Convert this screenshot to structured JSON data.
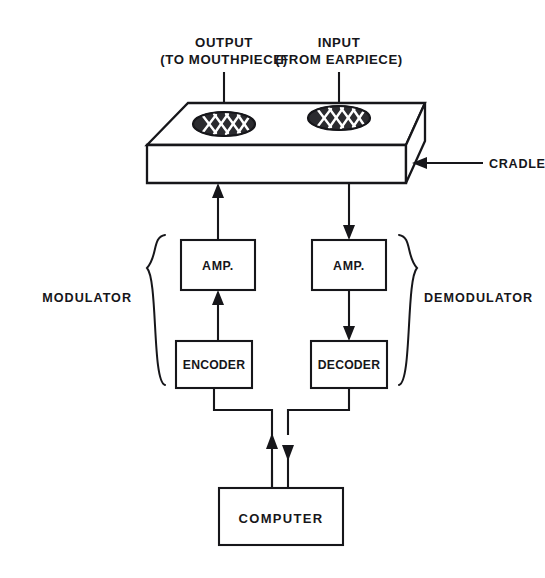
{
  "diagram": {
    "background_color": "#ffffff",
    "ink_color": "#16161a",
    "grille_fill_color": "#2b2b2f"
  },
  "captions": {
    "output_line1": "OUTPUT",
    "output_line2": "(TO MOUTHPIECE)",
    "input_line1": "INPUT",
    "input_line2": "(FROM EARPIECE)"
  },
  "cradle": {
    "label": "CRADLE",
    "grilles": [
      {
        "name": "output-grille",
        "role": "to-mouthpiece"
      },
      {
        "name": "input-grille",
        "role": "from-earpiece"
      }
    ]
  },
  "groups": {
    "left": {
      "label": "MODULATOR",
      "brace": "left-curly-brace"
    },
    "right": {
      "label": "DEMODULATOR",
      "brace": "right-curly-brace"
    }
  },
  "blocks": {
    "amp_left": "AMP.",
    "amp_right": "AMP.",
    "encoder": "ENCODER",
    "decoder": "DECODER",
    "computer": "COMPUTER"
  },
  "signal_flow": {
    "transmit_path": [
      "COMPUTER",
      "ENCODER",
      "AMP.",
      "CRADLE",
      "OUTPUT (TO MOUTHPIECE)"
    ],
    "receive_path": [
      "INPUT (FROM EARPIECE)",
      "CRADLE",
      "AMP.",
      "DECODER",
      "COMPUTER"
    ],
    "arrows": [
      {
        "name": "output-arrow",
        "direction": "up"
      },
      {
        "name": "input-arrow",
        "direction": "down"
      },
      {
        "name": "encoder-to-amp-arrow",
        "direction": "up"
      },
      {
        "name": "amp-to-cradle-arrow",
        "direction": "up"
      },
      {
        "name": "cradle-to-amp-arrow",
        "direction": "down"
      },
      {
        "name": "amp-to-decoder-arrow",
        "direction": "down"
      },
      {
        "name": "computer-to-encoder-arrow",
        "direction": "up"
      },
      {
        "name": "decoder-to-computer-arrow",
        "direction": "down"
      },
      {
        "name": "cradle-callout-arrow",
        "direction": "left"
      }
    ]
  }
}
